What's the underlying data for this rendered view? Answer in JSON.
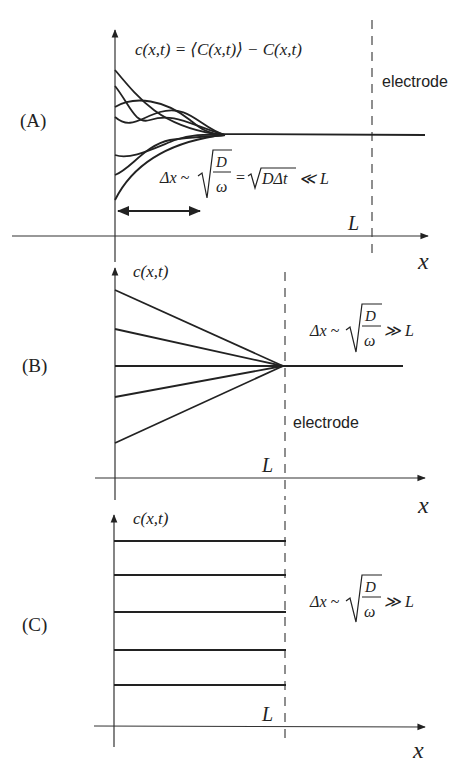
{
  "panels": [
    {
      "id": "A",
      "label": "(A)",
      "y_axis_label": "c(x,t) = ⟨C(x,t)⟩ − C(x,t)",
      "x_axis_label": "x",
      "boundary_label": "L",
      "electrode_label": "electrode",
      "relation": {
        "lhs": "Δx ~",
        "frac_num": "D",
        "frac_den": "ω",
        "middle": "=",
        "sqrt2": "DΔt",
        "rhs": "≪ L"
      },
      "description": "Oscillating concentration profiles decaying within diffusion length Δx much smaller than L"
    },
    {
      "id": "B",
      "label": "(B)",
      "y_axis_label": "c(x,t)",
      "x_axis_label": "x",
      "boundary_label": "L",
      "electrode_label": "electrode",
      "relation": {
        "lhs": "Δx ~",
        "frac_num": "D",
        "frac_den": "ω",
        "rhs": "≫ L"
      },
      "description": "Linear profiles converging at the electrode at x = L"
    },
    {
      "id": "C",
      "label": "(C)",
      "y_axis_label": "c(x,t)",
      "x_axis_label": "x",
      "boundary_label": "L",
      "relation": {
        "lhs": "Δx ~",
        "frac_num": "D",
        "frac_den": "ω",
        "rhs": "≫ L"
      },
      "description": "Uniform (flat) profiles up to x = L"
    }
  ]
}
